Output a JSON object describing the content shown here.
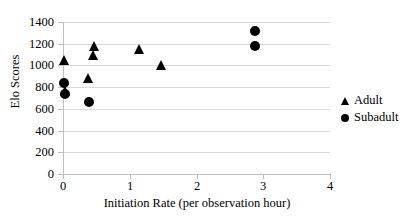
{
  "chart_data": {
    "type": "scatter",
    "title": "",
    "xlabel": "Initiation Rate (per observation hour)",
    "ylabel": "Elo Scores",
    "xlim": [
      0,
      4
    ],
    "ylim": [
      0,
      1400
    ],
    "xticks": [
      "0",
      "1",
      "2",
      "3",
      "4"
    ],
    "xtick_values": [
      0,
      1,
      2,
      3,
      4
    ],
    "yticks": [
      "0",
      "200",
      "400",
      "600",
      "800",
      "1000",
      "1200",
      "1400"
    ],
    "ytick_values": [
      0,
      200,
      400,
      600,
      800,
      1000,
      1200,
      1400
    ],
    "grid": "horizontal",
    "legend_position": "right",
    "series": [
      {
        "name": "Adult",
        "marker": "triangle",
        "color": "#000000",
        "points": [
          {
            "x": 0.02,
            "y": 1050
          },
          {
            "x": 0.03,
            "y": 760
          },
          {
            "x": 0.38,
            "y": 880
          },
          {
            "x": 0.47,
            "y": 1180
          },
          {
            "x": 0.46,
            "y": 1100
          },
          {
            "x": 1.15,
            "y": 1150
          },
          {
            "x": 1.47,
            "y": 1000
          }
        ]
      },
      {
        "name": "Subadult",
        "marker": "circle",
        "color": "#000000",
        "points": [
          {
            "x": 0.02,
            "y": 840
          },
          {
            "x": 0.03,
            "y": 740
          },
          {
            "x": 0.39,
            "y": 660
          },
          {
            "x": 2.88,
            "y": 1320
          },
          {
            "x": 2.88,
            "y": 1180
          }
        ]
      }
    ]
  },
  "legend": {
    "items": [
      {
        "label": "Adult",
        "marker": "triangle"
      },
      {
        "label": "Subadult",
        "marker": "circle"
      }
    ]
  }
}
